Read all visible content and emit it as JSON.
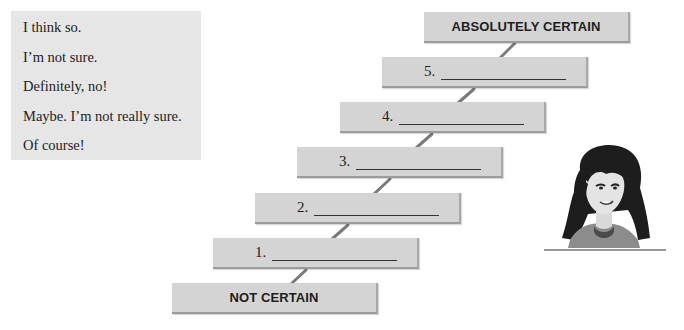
{
  "phrases": [
    "I think so.",
    "I’m not sure.",
    "Definitely, no!",
    "Maybe. I’m not really sure.",
    "Of course!"
  ],
  "scale": {
    "top_label": "ABSOLUTELY CERTAIN",
    "bottom_label": "NOT CERTAIN",
    "steps": [
      {
        "number": "5.",
        "answer": ""
      },
      {
        "number": "4.",
        "answer": ""
      },
      {
        "number": "3.",
        "answer": ""
      },
      {
        "number": "2.",
        "answer": ""
      },
      {
        "number": "1.",
        "answer": ""
      }
    ]
  },
  "illustration": {
    "subject": "girl-character-thinking"
  },
  "colors": {
    "box_fill": "#d4d4d4",
    "phrase_box_fill": "#e6e6e6",
    "connector": "#7a7a7a"
  }
}
